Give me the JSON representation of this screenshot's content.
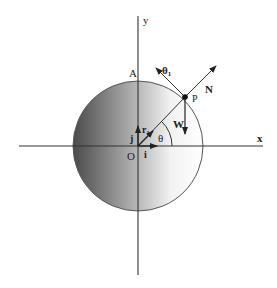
{
  "diagram": {
    "axes": {
      "x_label": "x",
      "y_label": "y",
      "origin_label": "O"
    },
    "points": {
      "top_label": "A",
      "particle_label": "P"
    },
    "unit_vectors": {
      "i": "i",
      "j": "j",
      "r1": "r",
      "r1_sub": "1",
      "theta1": "θ",
      "theta1_sub": "1"
    },
    "forces": {
      "normal": "N",
      "weight": "W"
    },
    "angle": {
      "label": "θ"
    },
    "colors": {
      "sphere_dark": "#4a4a4a",
      "sphere_light": "#ffffff",
      "line": "#333333"
    }
  }
}
